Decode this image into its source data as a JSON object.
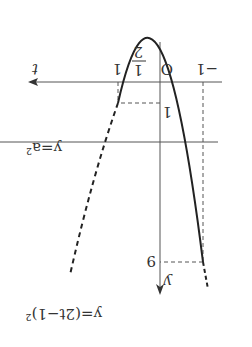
{
  "figure": {
    "rotation_deg": 180,
    "axes": {
      "x_label": "t",
      "y_label": "y",
      "origin": "O"
    },
    "ticks": {
      "t_neg1": "−1",
      "t_half_num": "1",
      "t_half_den": "2",
      "t_one": "1",
      "y_one": "1",
      "y_nine": "9"
    },
    "curve_label": "y=(2t−1)²",
    "line_label": "y=a²"
  }
}
